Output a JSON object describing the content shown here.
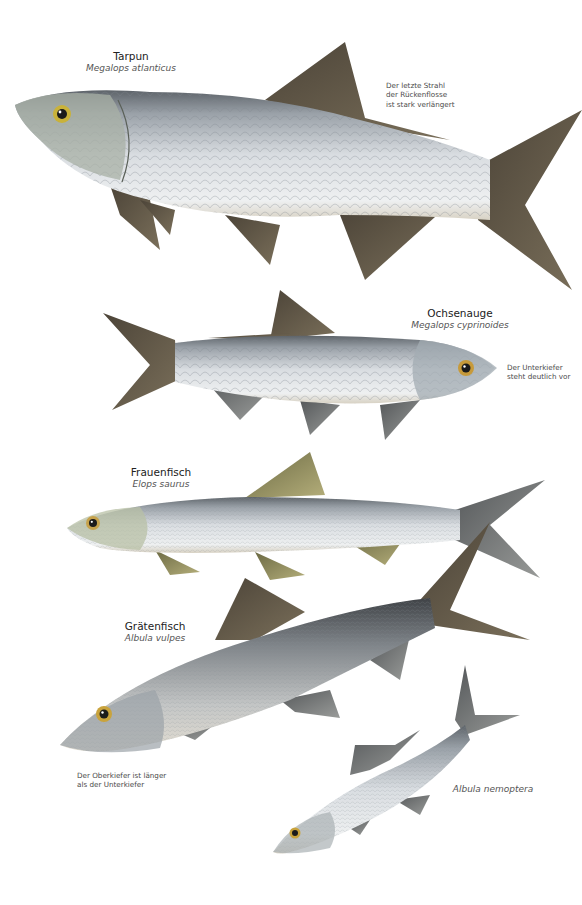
{
  "plate": {
    "species": [
      {
        "id": "tarpun",
        "common_name": "Tarpun",
        "latin_name": "Megalops atlanticus",
        "note_lines": [
          "Der letzte Strahl",
          "der Rückenflosse",
          "ist stark verlängert"
        ]
      },
      {
        "id": "ochsenauge",
        "common_name": "Ochsenauge",
        "latin_name": "Megalops cyprinoides",
        "note_lines": [
          "Der Unterkiefer",
          "steht deutlich vor"
        ]
      },
      {
        "id": "frauenfisch",
        "common_name": "Frauenfisch",
        "latin_name": "Elops saurus"
      },
      {
        "id": "graetenfisch",
        "common_name": "Grätenfisch",
        "latin_name": "Albula vulpes",
        "note_lines": [
          "Der Oberkiefer ist länger",
          "als der Unterkiefer"
        ]
      },
      {
        "id": "albula-nemoptera",
        "latin_name": "Albula nemoptera"
      }
    ],
    "colors": {
      "background": "#ffffff",
      "body_silver": "#c9ced3",
      "body_dark": "#6d7176",
      "fin_brown": "#5e5444",
      "fin_olive": "#8f8a5a",
      "eye_gold": "#c9a53a"
    }
  }
}
